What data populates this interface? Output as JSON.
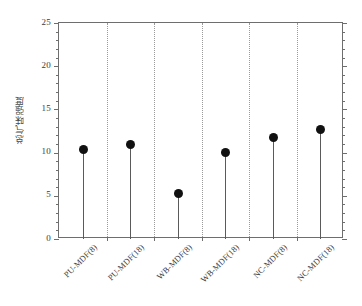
{
  "chart_data": {
    "type": "scatter",
    "title": "",
    "subtitle": "",
    "xlabel": "",
    "ylabel": "总气味强度",
    "categories": [
      "PU-MDF(8)",
      "PU-MDF(18)",
      "WB-MDF(8)",
      "WB-MDF(18)",
      "NC-MDF(8)",
      "NC-MDF(18)"
    ],
    "values": [
      10.4,
      10.9,
      5.3,
      10.0,
      11.7,
      12.7
    ],
    "ylim": [
      0,
      25
    ],
    "ytick_labels": [
      "0",
      "5",
      "10",
      "15",
      "20",
      "25"
    ],
    "ytick_values": [
      0,
      5,
      10,
      15,
      20,
      25
    ],
    "yminor_step": 1,
    "grid": "vertical-dotted-category-separators",
    "legend": "none",
    "marker": "filled-circle",
    "marker_color": "#111111",
    "stem_color": "#5a5a5a",
    "axis_color": "#6e6e6e",
    "background": "#ffffff"
  }
}
